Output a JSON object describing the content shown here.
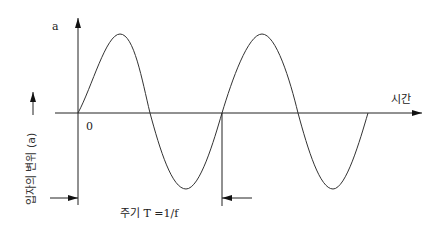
{
  "diagram": {
    "title": "",
    "y_axis_top_label": "a",
    "origin_label": "0",
    "x_axis_label": "시간",
    "y_axis_label": "입자의 변위 (a)",
    "period_label": "주기 T =1/f",
    "curve": "sine wave, two full periods",
    "colors": {
      "line": "#222222",
      "background": "#ffffff"
    }
  }
}
